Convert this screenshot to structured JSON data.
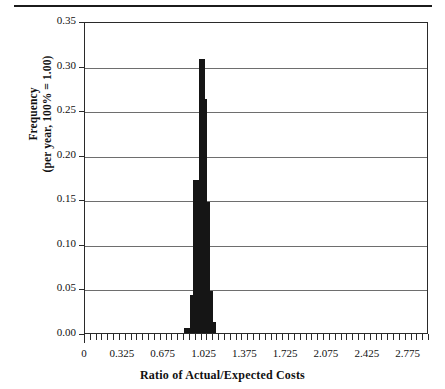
{
  "chart_data": {
    "type": "bar",
    "title": "",
    "subtitle": "",
    "xlabel": "Ratio of Actual/Expected Costs",
    "ylabel": "Frequency (per year, 100% = 1.00)",
    "ylabel_lines": [
      "Frequency",
      "(per year, 100% = 1.00)"
    ],
    "xlim": [
      0,
      2.95
    ],
    "ylim": [
      0,
      0.35
    ],
    "grid": true,
    "legend": null,
    "y_ticks": [
      0.0,
      0.05,
      0.1,
      0.15,
      0.2,
      0.25,
      0.3,
      0.35
    ],
    "y_tick_labels": [
      "0.00",
      "0.05",
      "0.10",
      "0.15",
      "0.20",
      "0.25",
      "0.30",
      "0.35"
    ],
    "x_tick_labels": [
      "0",
      "0.325",
      "0.675",
      "1.025",
      "1.375",
      "1.725",
      "2.075",
      "2.425",
      "2.775"
    ],
    "x_tick_values": [
      0,
      0.325,
      0.675,
      1.025,
      1.375,
      1.725,
      2.075,
      2.425,
      2.775
    ],
    "x_minor_tick_step": 0.05,
    "bar_width": 0.05,
    "categories": [
      0.875,
      0.925,
      0.95,
      0.975,
      1.0,
      1.025,
      1.05,
      1.075,
      1.1
    ],
    "values": [
      0.006,
      0.043,
      0.172,
      0.152,
      0.307,
      0.262,
      0.147,
      0.047,
      0.012
    ],
    "bar_color": "#151515",
    "axis_color": "#2a2a2a",
    "grid_color": "#6e6e6e"
  },
  "figure": {
    "background": "#ffffff",
    "has_top_rule": true
  }
}
